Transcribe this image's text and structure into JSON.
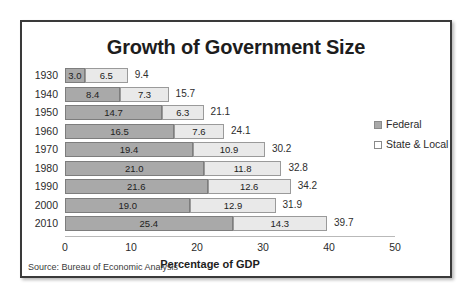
{
  "figure": {
    "title": "Growth of Government Size",
    "source": "Source: Bureau of Economic Analysis",
    "legend": {
      "items": [
        {
          "label": "Federal",
          "swatch": "federal-swatch",
          "color": "#a9a9a9"
        },
        {
          "label": "State & Local",
          "swatch": "state-local-swatch",
          "color": "#ffffff"
        }
      ]
    }
  },
  "chart_data": {
    "type": "bar",
    "orientation": "horizontal",
    "stacked": true,
    "title": "Growth of Government Size",
    "xlabel": "Percentage of GDP",
    "ylabel": "",
    "xlim": [
      0,
      50
    ],
    "xticks": [
      0,
      10,
      20,
      30,
      40,
      50
    ],
    "xtick_labels": [
      "0",
      "10",
      "20",
      "30",
      "40",
      "50"
    ],
    "grid": false,
    "legend_position": "right",
    "categories": [
      "1930",
      "1940",
      "1950",
      "1960",
      "1970",
      "1980",
      "1990",
      "2000",
      "2010"
    ],
    "series": [
      {
        "name": "Federal",
        "color": "#a9a9a9",
        "values": [
          3.0,
          8.4,
          14.7,
          16.5,
          19.4,
          21.0,
          21.6,
          19.0,
          25.4
        ],
        "labels": [
          "3.0",
          "8.4",
          "14.7",
          "16.5",
          "19.4",
          "21.0",
          "21.6",
          "19.0",
          "25.4"
        ]
      },
      {
        "name": "State & Local",
        "color": "#e9e9e9",
        "values": [
          6.5,
          7.3,
          6.3,
          7.6,
          10.9,
          11.8,
          12.6,
          12.9,
          14.3
        ],
        "labels": [
          "6.5",
          "7.3",
          "6.3",
          "7.6",
          "10.9",
          "11.8",
          "12.6",
          "12.9",
          "14.3"
        ]
      }
    ],
    "totals": [
      9.4,
      15.7,
      21.1,
      24.1,
      30.2,
      32.8,
      34.2,
      31.9,
      39.7
    ],
    "total_labels": [
      "9.4",
      "15.7",
      "21.1",
      "24.1",
      "30.2",
      "32.8",
      "34.2",
      "31.9",
      "39.7"
    ],
    "annotations": [
      "Source: Bureau of Economic Analysis"
    ]
  }
}
